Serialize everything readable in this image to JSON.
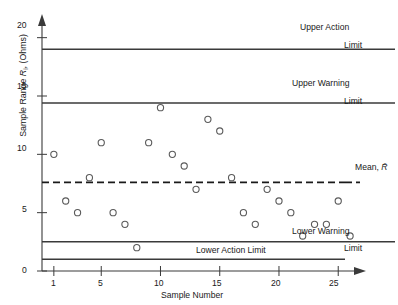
{
  "chart_data": {
    "type": "scatter",
    "title": "",
    "xlabel": "Sample Number",
    "ylabel": "Sample Range R, (Ohms)",
    "ylabel_symbol": "R",
    "ylabel_sub": "i",
    "ylabel_units": "(Ohms)",
    "ylabel_prefix": "Sample Range",
    "xlim": [
      0,
      26.5
    ],
    "ylim": [
      0,
      21
    ],
    "xticks": [
      1,
      5,
      10,
      15,
      20,
      25
    ],
    "yticks": [
      0,
      5,
      10,
      15,
      20
    ],
    "xticklabels": [
      "1",
      "5",
      "10",
      "15",
      "20",
      "25"
    ],
    "yticklabels": [
      "0",
      "5",
      "10",
      "15",
      "20"
    ],
    "grid": false,
    "legend": "none",
    "x": [
      1,
      2,
      3,
      4,
      5,
      6,
      7,
      8,
      9,
      10,
      11,
      12,
      13,
      14,
      15,
      16,
      17,
      18,
      19,
      20,
      21,
      22,
      23,
      24,
      25,
      26
    ],
    "values": [
      10,
      6,
      5,
      8,
      11,
      5,
      4,
      2,
      11,
      14,
      10,
      9,
      7,
      13,
      12,
      8,
      5,
      4,
      7,
      6,
      5,
      3,
      4,
      4,
      6,
      3
    ],
    "series": [
      {
        "name": "Sample Range",
        "values": [
          10,
          6,
          5,
          8,
          11,
          5,
          4,
          2,
          11,
          14,
          10,
          9,
          7,
          13,
          12,
          8,
          5,
          4,
          7,
          6,
          5,
          3,
          4,
          4,
          6,
          3
        ]
      }
    ],
    "reference_lines": [
      {
        "id": "upper-action-limit",
        "label": "Upper Action",
        "label2": "Limit",
        "value": 19.0,
        "style": "solid"
      },
      {
        "id": "upper-warning-limit",
        "label": "Upper Warning",
        "label2": "Limit",
        "value": 14.4,
        "style": "solid"
      },
      {
        "id": "mean-line",
        "label": "Mean, R̄",
        "value": 7.6,
        "style": "dashed"
      },
      {
        "id": "lower-warning-limit",
        "label": "Lower Warning",
        "label2": "Limit",
        "value": 2.5,
        "style": "solid"
      },
      {
        "id": "lower-action-limit",
        "label": "Lower Action Limit",
        "value": 1.0,
        "style": "solid"
      }
    ]
  },
  "annotations": {
    "upper_action_l1": "Upper Action",
    "upper_action_l2": "Limit",
    "upper_warning_l1": "Upper Warning",
    "upper_warning_l2": "Limit",
    "mean_label": "Mean,",
    "mean_symbol": "R̄",
    "lower_warning_l1": "Lower Warning",
    "lower_warning_l2": "Limit",
    "lower_action_label": "Lower Action Limit"
  },
  "axes": {
    "x_title": "Sample Number",
    "y_title_prefix": "Sample Range",
    "y_title_symbol": "R",
    "y_title_sub": "i",
    "y_title_units": "(Ohms)",
    "x_tick_1": "1",
    "x_tick_5": "5",
    "x_tick_10": "10",
    "x_tick_15": "15",
    "x_tick_20": "20",
    "x_tick_25": "25",
    "y_tick_0": "0",
    "y_tick_5": "5",
    "y_tick_10": "10",
    "y_tick_15": "15",
    "y_tick_20": "20"
  }
}
